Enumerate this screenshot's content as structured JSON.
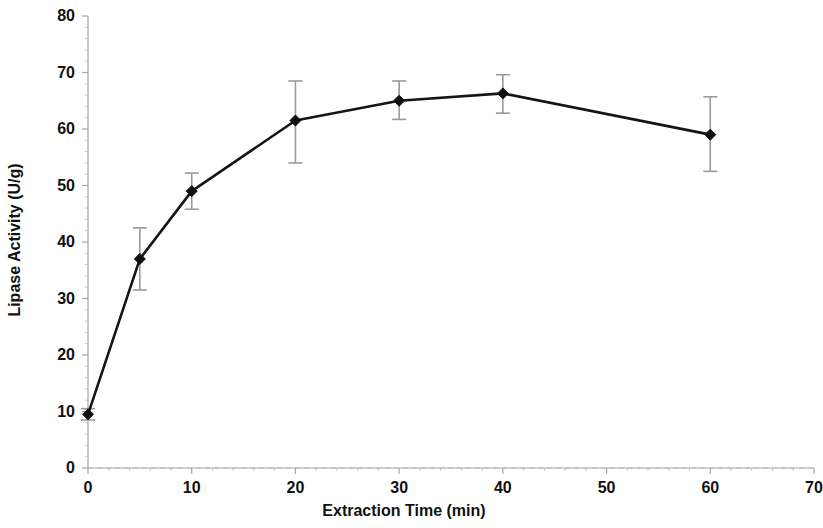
{
  "chart_data": {
    "type": "line",
    "title": "",
    "xlabel": "Extraction Time (min)",
    "ylabel": "Lipase Activity (U/g)",
    "xlim": [
      0,
      70
    ],
    "ylim": [
      0,
      80
    ],
    "xticks": [
      0,
      10,
      20,
      30,
      40,
      50,
      60,
      70
    ],
    "xtick_labels": [
      "0",
      "10",
      "20",
      "30",
      "40",
      "50",
      "60",
      "70"
    ],
    "yticks": [
      0,
      10,
      20,
      30,
      40,
      50,
      60,
      70,
      80
    ],
    "ytick_labels": [
      "0",
      "10",
      "20",
      "30",
      "40",
      "50",
      "60",
      "70",
      "80"
    ],
    "grid": false,
    "legend": null,
    "marker": "diamond",
    "line_color": "#151515",
    "error_bar_color": "#9a9a9a",
    "x": [
      0,
      5,
      10,
      20,
      30,
      40,
      60
    ],
    "values": [
      9.5,
      37.0,
      49.0,
      61.5,
      65.0,
      66.3,
      59.0
    ],
    "yerr_upper": [
      1.0,
      5.5,
      3.2,
      7.0,
      3.5,
      3.3,
      6.7
    ],
    "yerr_lower": [
      1.0,
      5.5,
      3.2,
      7.5,
      3.3,
      3.5,
      6.5
    ],
    "series": [
      {
        "name": "Lipase Activity",
        "points": [
          {
            "x": 0,
            "y": 9.5,
            "err_up": 1.0,
            "err_dn": 1.0
          },
          {
            "x": 5,
            "y": 37.0,
            "err_up": 5.5,
            "err_dn": 5.5
          },
          {
            "x": 10,
            "y": 49.0,
            "err_up": 3.2,
            "err_dn": 3.2
          },
          {
            "x": 20,
            "y": 61.5,
            "err_up": 7.0,
            "err_dn": 7.5
          },
          {
            "x": 30,
            "y": 65.0,
            "err_up": 3.5,
            "err_dn": 3.3
          },
          {
            "x": 40,
            "y": 66.3,
            "err_up": 3.3,
            "err_dn": 3.5
          },
          {
            "x": 60,
            "y": 59.0,
            "err_up": 6.7,
            "err_dn": 6.5
          }
        ]
      }
    ]
  }
}
